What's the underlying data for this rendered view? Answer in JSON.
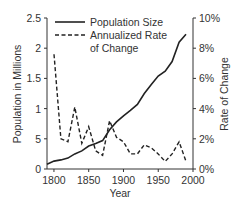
{
  "chart_data": {
    "type": "line",
    "title": "",
    "xlabel": "Year",
    "ylabel": "Population in Millions",
    "y2label": "Rate of Change",
    "xlim": [
      1790,
      2000
    ],
    "ylim": [
      0,
      2.5
    ],
    "y2lim": [
      0,
      10
    ],
    "x_ticks": [
      "1800",
      "1850",
      "1900",
      "1950",
      "2000"
    ],
    "y_ticks": [
      "0",
      "5",
      "1",
      "1.5",
      "2",
      "2.5"
    ],
    "y2_ticks": [
      "0%",
      "2%",
      "4%",
      "6%",
      "8%",
      "10%"
    ],
    "legend": [
      "Population Size",
      "Annualized Rate",
      "of Change"
    ],
    "legend_position": "upper left",
    "grid": false,
    "series": [
      {
        "name": "Population Size",
        "axis": "left",
        "style": "solid",
        "x": [
          1790,
          1800,
          1810,
          1820,
          1830,
          1840,
          1850,
          1860,
          1870,
          1880,
          1890,
          1900,
          1910,
          1920,
          1930,
          1940,
          1950,
          1960,
          1970,
          1980,
          1990
        ],
        "values": [
          0.08,
          0.13,
          0.15,
          0.18,
          0.25,
          0.3,
          0.38,
          0.42,
          0.47,
          0.65,
          0.78,
          0.88,
          0.97,
          1.07,
          1.25,
          1.4,
          1.54,
          1.62,
          1.78,
          2.1,
          2.23
        ]
      },
      {
        "name": "Annualized Rate of Change",
        "axis": "right",
        "style": "dashed",
        "x": [
          1800,
          1810,
          1820,
          1830,
          1840,
          1850,
          1860,
          1870,
          1880,
          1890,
          1900,
          1910,
          1920,
          1930,
          1940,
          1950,
          1960,
          1970,
          1980,
          1990
        ],
        "values": [
          7.6,
          2.0,
          1.8,
          4.1,
          1.7,
          2.8,
          1.2,
          0.9,
          3.2,
          2.1,
          1.8,
          1.0,
          1.0,
          1.6,
          1.4,
          1.0,
          0.5,
          1.0,
          1.8,
          0.5
        ]
      }
    ]
  }
}
